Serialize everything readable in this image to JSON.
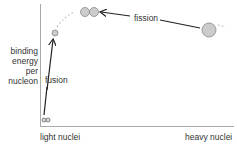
{
  "diagram": {
    "y_axis_label": [
      "binding",
      "energy",
      "per",
      "nucleon"
    ],
    "x_axis_labels": {
      "left": "light nuclei",
      "right": "heavy nuclei"
    },
    "annotations": {
      "fusion": "fusion",
      "fission": "fission"
    },
    "colors": {
      "axis": "#aaaaaa",
      "nucleus_fill": "#cccccc",
      "nucleus_stroke": "#888888",
      "arrow": "#222222",
      "curve": "#bbbbbb"
    }
  }
}
